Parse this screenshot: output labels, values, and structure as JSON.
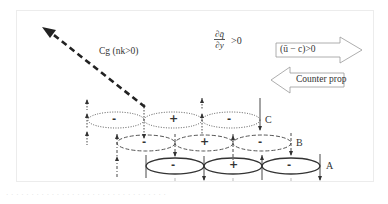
{
  "figure": {
    "group_velocity_label": "Cg (nk>0)",
    "pv_gradient": {
      "numerator": "∂q̄",
      "denominator": "∂y",
      "relation": ">0"
    },
    "right_arrow_label": "(ū − c)>0",
    "left_arrow_label": "Counter prop",
    "rows": [
      {
        "id": "C",
        "label": "C",
        "line_style": "dotted",
        "signs": [
          "-",
          "+",
          "-"
        ]
      },
      {
        "id": "B",
        "label": "B",
        "line_style": "dashed",
        "signs": [
          "-",
          "+",
          "-"
        ]
      },
      {
        "id": "A",
        "label": "A",
        "line_style": "solid",
        "signs": [
          "-",
          "+",
          "-"
        ]
      }
    ],
    "caption": "· · · · · · · · · · · · · · · · · · · · · · · · · · · · · · · ·",
    "colors": {
      "line": "#444444",
      "frame": "#ececec",
      "arrow_outline": "#888888"
    }
  }
}
